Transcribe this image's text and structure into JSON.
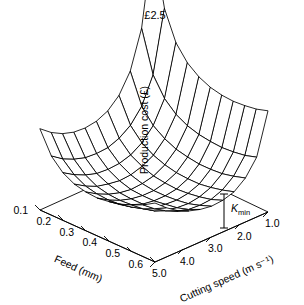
{
  "chart_data": {
    "type": "surface",
    "title": "",
    "top_value_label": "£2.5",
    "zlabel": "Production cost (£)",
    "xlabel": "Feed (mm)",
    "ylabel": "Cutting speed (m s⁻¹)",
    "xticks": [
      "0.1",
      "0.2",
      "0.3",
      "0.4",
      "0.5",
      "0.6"
    ],
    "yticks": [
      "5.0",
      "4.0",
      "3.0",
      "2.0",
      "1.0"
    ],
    "xlim": [
      0.1,
      0.6
    ],
    "ylim": [
      1.0,
      5.0
    ],
    "zlim": [
      0,
      2.5
    ],
    "grid": false,
    "legend": false,
    "annotations": [
      {
        "name": "k-min",
        "text_main": "K",
        "text_sub": "min",
        "meaning": "minimum production cost point on surface"
      }
    ],
    "feed_values": [
      0.1,
      0.15,
      0.2,
      0.25,
      0.3,
      0.35,
      0.4,
      0.45,
      0.5,
      0.55,
      0.6
    ],
    "speed_values": [
      1.0,
      1.4,
      1.8,
      2.2,
      2.6,
      3.0,
      3.4,
      3.8,
      4.2,
      4.6,
      5.0
    ],
    "z_matrix": [
      [
        2.5,
        1.55,
        1.12,
        0.9,
        0.78,
        0.72,
        0.7,
        0.71,
        0.75,
        0.82,
        0.92
      ],
      [
        1.78,
        1.08,
        0.78,
        0.62,
        0.53,
        0.48,
        0.47,
        0.48,
        0.52,
        0.58,
        0.67
      ],
      [
        1.45,
        0.87,
        0.62,
        0.48,
        0.4,
        0.36,
        0.35,
        0.36,
        0.4,
        0.46,
        0.54
      ],
      [
        1.28,
        0.75,
        0.53,
        0.4,
        0.33,
        0.29,
        0.28,
        0.3,
        0.33,
        0.39,
        0.47
      ],
      [
        1.18,
        0.68,
        0.47,
        0.35,
        0.28,
        0.25,
        0.24,
        0.26,
        0.3,
        0.36,
        0.44
      ],
      [
        1.12,
        0.64,
        0.44,
        0.32,
        0.26,
        0.23,
        0.23,
        0.25,
        0.29,
        0.35,
        0.43
      ],
      [
        1.09,
        0.62,
        0.42,
        0.31,
        0.25,
        0.23,
        0.23,
        0.25,
        0.3,
        0.36,
        0.45
      ],
      [
        1.08,
        0.61,
        0.42,
        0.31,
        0.26,
        0.24,
        0.25,
        0.27,
        0.32,
        0.39,
        0.48
      ],
      [
        1.09,
        0.62,
        0.43,
        0.33,
        0.28,
        0.26,
        0.27,
        0.3,
        0.35,
        0.43,
        0.53
      ],
      [
        1.11,
        0.64,
        0.46,
        0.36,
        0.31,
        0.3,
        0.31,
        0.35,
        0.41,
        0.49,
        0.59
      ],
      [
        1.15,
        0.68,
        0.5,
        0.4,
        0.36,
        0.35,
        0.37,
        0.41,
        0.47,
        0.56,
        0.67
      ]
    ],
    "minimum_point": {
      "feed": 0.35,
      "speed": 3.0,
      "cost": 0.23
    }
  },
  "colors": {
    "background": "#ffffff",
    "line": "#000000",
    "text": "#000000"
  }
}
